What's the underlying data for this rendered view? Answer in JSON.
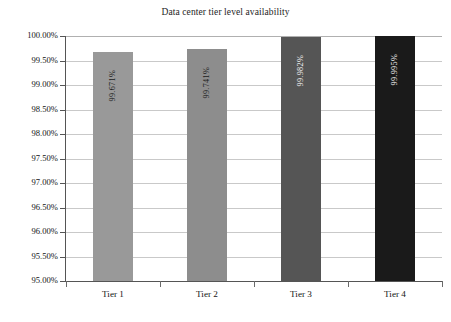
{
  "chart_data": {
    "type": "bar",
    "title": "Data center tier level availability",
    "xlabel": "",
    "ylabel": "",
    "categories": [
      "Tier 1",
      "Tier 2",
      "Tier 3",
      "Tier 4"
    ],
    "values": [
      99.671,
      99.741,
      99.982,
      99.995
    ],
    "value_labels": [
      "99.671%",
      "99.741%",
      "99.982%",
      "99.995%"
    ],
    "bar_colors": [
      "#999999",
      "#8d8d8d",
      "#555555",
      "#1a1a1a"
    ],
    "label_colors": [
      "#1c1c1c",
      "#1c1c1c",
      "#f2f2f2",
      "#f2f2f2"
    ],
    "ylim": [
      95.0,
      100.0
    ],
    "ytick_values": [
      100.0,
      99.5,
      99.0,
      98.5,
      98.0,
      97.5,
      97.0,
      96.5,
      96.0,
      95.5,
      95.0
    ],
    "ytick_labels": [
      "100.00%",
      "99.50%",
      "99.00%",
      "98.50%",
      "98.00%",
      "97.50%",
      "97.00%",
      "96.50%",
      "96.00%",
      "95.50%",
      "95.00%"
    ],
    "grid": true,
    "grid_orientation": "horizontal",
    "legend": false,
    "legend_position": "none",
    "label_rotation": 90,
    "label_placement": "inside-bar"
  },
  "colors": {
    "background": "#ffffff",
    "axis": "#555555",
    "gridline": "#c9c9c9",
    "text": "#141414"
  }
}
